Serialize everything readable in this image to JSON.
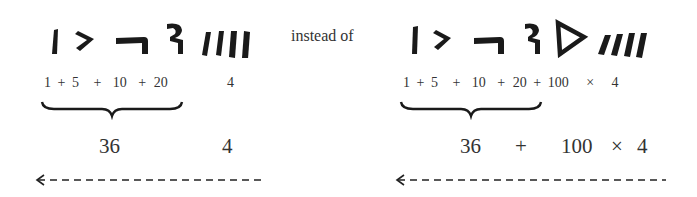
{
  "figure": {
    "connector_label": "instead of",
    "left": {
      "glyphs": [
        "one-stroke",
        "five-angle",
        "ten-hook",
        "twenty-glyph",
        "four-strokes"
      ],
      "expression_terms": [
        "1",
        "+",
        "5",
        "+",
        "10",
        "+",
        "20",
        "4"
      ],
      "grouped_sum": "36",
      "multiplier_value": "4",
      "reading_direction": "right-to-left"
    },
    "right": {
      "glyphs": [
        "one-stroke",
        "five-angle",
        "ten-hook",
        "twenty-glyph",
        "hundred-triangle",
        "four-strokes"
      ],
      "expression_terms": [
        "1",
        "+",
        "5",
        "+",
        "10",
        "+",
        "20",
        "+",
        "100",
        "×",
        "4"
      ],
      "grouped_sum": "36",
      "plus": "+",
      "hundred": "100",
      "times": "×",
      "multiplier_value": "4",
      "reading_direction": "right-to-left"
    },
    "colors": {
      "ink": "#1a1a1a",
      "text": "#333333",
      "background": "#ffffff"
    }
  }
}
